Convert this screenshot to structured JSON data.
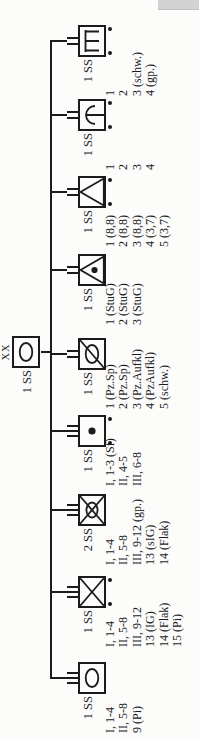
{
  "document": {
    "type": "military organization chart (Kriegsgliederung), page rotated 90 degrees",
    "ink_color": "#1b1b1b",
    "background_color": "#fcfcfb"
  },
  "chart": {
    "root": {
      "label": "1 SS",
      "echelon": "XX",
      "symbol": "panzer"
    },
    "children": [
      {
        "label": "1 SS",
        "echelon": "III",
        "symbol": "panzer",
        "motorized_dots": false,
        "items": [
          "I, 1-4",
          "II, 5-8",
          "9 (Pi)"
        ]
      },
      {
        "label": "1 SS",
        "echelon": "III",
        "symbol": "infantry",
        "motorized_dots": true,
        "items": [
          "I, 1-4",
          "II, 5-8",
          "III, 9-12",
          "13 (IG)",
          "14 (Flak)",
          "15 (Pi)"
        ]
      },
      {
        "label": "2 SS",
        "echelon": "III",
        "symbol": "panzergrenadier",
        "motorized_dots": false,
        "items": [
          "I, 1-4",
          "II, 5-8",
          "III, 9-12 (gp.)",
          "13 (sIG)",
          "14 (Flak)"
        ]
      },
      {
        "label": "1 SS",
        "echelon": "III",
        "symbol": "artillery",
        "motorized_dots": true,
        "items": [
          "I, 1-3 (Sf)",
          "II, 4-5",
          "III, 6-8"
        ]
      },
      {
        "label": "1 SS",
        "echelon": "II",
        "symbol": "armored-recon",
        "motorized_dots": false,
        "items": [
          "1 (Pz.Sp)",
          "2 (Pz.Sp)",
          "3 (Pz.Aufkl)",
          "4 (PzAufkl)",
          "5 (schw.)"
        ]
      },
      {
        "label": "1 SS",
        "echelon": "II",
        "symbol": "sturmgeschuetz",
        "motorized_dots": false,
        "items": [
          "1 (StuG)",
          "2 (StuG)",
          "3 (StuG)"
        ]
      },
      {
        "label": "1 SS",
        "echelon": "II",
        "symbol": "flak",
        "motorized_dots": true,
        "items": [
          "1 (8,8)",
          "2 (8,8)",
          "3 (8,8)",
          "4 (3,7)",
          "5 (3,7)"
        ]
      },
      {
        "label": "1 SS",
        "echelon": "II",
        "symbol": "werfer",
        "motorized_dots": true,
        "items": [
          "1",
          "2",
          "3",
          "4"
        ]
      },
      {
        "label": "1 SS",
        "echelon": "II",
        "symbol": "pionier",
        "motorized_dots": true,
        "items": [
          "1",
          "2",
          "3 (schw.)",
          "4 (gp.)"
        ]
      }
    ]
  }
}
